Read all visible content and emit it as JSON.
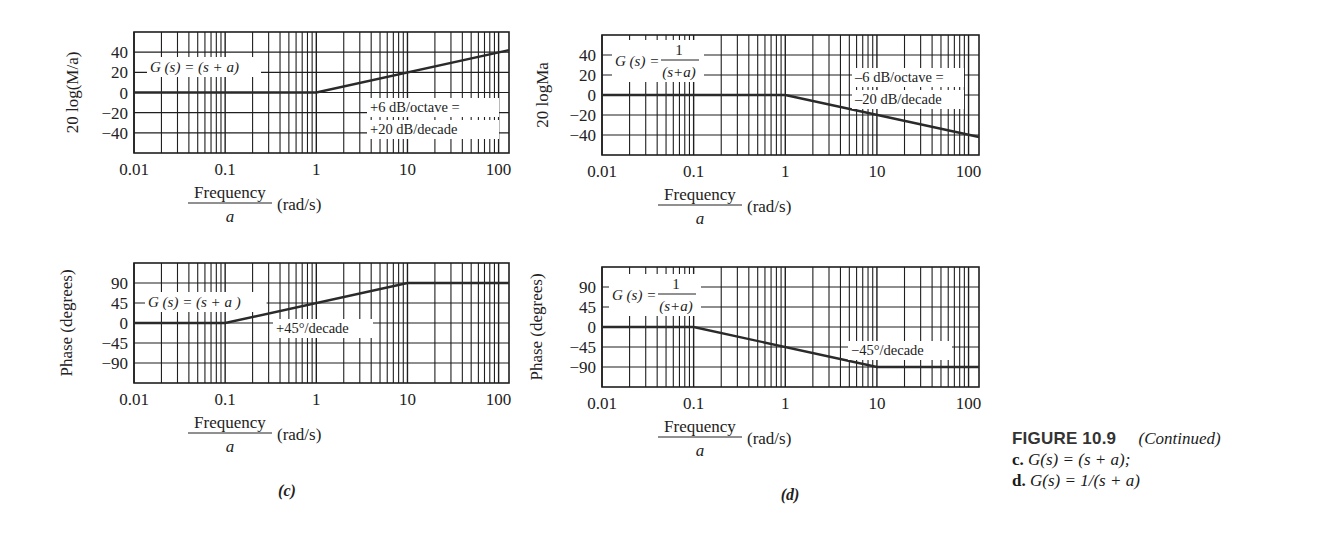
{
  "figure": {
    "number_label": "FIGURE 10.9",
    "continued_label": "(Continued)",
    "caption_lines": [
      {
        "prefix": "c.",
        "text": "G(s) = (s + a);"
      },
      {
        "prefix": "d.",
        "text": "G(s) = 1/(s + a)"
      }
    ],
    "panel_labels": [
      "(c)",
      "(d)"
    ]
  },
  "colors": {
    "grid": "#1f1f1f",
    "curve": "#2a2a2a",
    "text": "#1a1a1a",
    "background": "#ffffff"
  },
  "chart_data": [
    {
      "id": "c-magnitude",
      "type": "line",
      "panel": "c",
      "xscale": "log",
      "x_ticks": [
        "0.01",
        "0.1",
        "1",
        "10",
        "100"
      ],
      "xlim": [
        0.01,
        130
      ],
      "xlabel_num": "Frequency",
      "xlabel_den": "a",
      "xlabel_unit": "(rad/s)",
      "ylabel": "20 log(M/a)",
      "y_ticks": [
        40,
        20,
        0,
        -20,
        -40
      ],
      "ylim": [
        -60,
        60
      ],
      "grid": true,
      "transfer_function": "G (s) = (s + a)",
      "annotation": [
        "+6 dB/octave =",
        "+20 dB/decade"
      ],
      "series": [
        {
          "name": "asymptote",
          "x": [
            0.01,
            1,
            130
          ],
          "y": [
            0,
            0,
            42
          ]
        }
      ]
    },
    {
      "id": "d-magnitude",
      "type": "line",
      "panel": "d",
      "xscale": "log",
      "x_ticks": [
        "0.01",
        "0.1",
        "1",
        "10",
        "100"
      ],
      "xlim": [
        0.01,
        130
      ],
      "xlabel_num": "Frequency",
      "xlabel_den": "a",
      "xlabel_unit": "(rad/s)",
      "ylabel": "20 logMa",
      "y_ticks": [
        40,
        20,
        0,
        -20,
        -40
      ],
      "ylim": [
        -60,
        60
      ],
      "grid": true,
      "transfer_function_num": "1",
      "transfer_function_lhs": "G (s) =",
      "transfer_function_den": "(s+a)",
      "annotation": [
        "–6 dB/octave =",
        "–20 dB/decade"
      ],
      "series": [
        {
          "name": "asymptote",
          "x": [
            0.01,
            1,
            130
          ],
          "y": [
            0,
            0,
            -42
          ]
        }
      ]
    },
    {
      "id": "c-phase",
      "type": "line",
      "panel": "c",
      "xscale": "log",
      "x_ticks": [
        "0.01",
        "0.1",
        "1",
        "10",
        "100"
      ],
      "xlim": [
        0.01,
        130
      ],
      "xlabel_num": "Frequency",
      "xlabel_den": "a",
      "xlabel_unit": "(rad/s)",
      "ylabel": "Phase (degrees)",
      "y_ticks": [
        90,
        45,
        0,
        -45,
        -90
      ],
      "ylim": [
        -135,
        135
      ],
      "grid": true,
      "transfer_function": "G (s) = (s + a )",
      "annotation": [
        "+45°/decade"
      ],
      "series": [
        {
          "name": "asymptote",
          "x": [
            0.01,
            0.1,
            10,
            130
          ],
          "y": [
            0,
            0,
            90,
            90
          ]
        }
      ]
    },
    {
      "id": "d-phase",
      "type": "line",
      "panel": "d",
      "xscale": "log",
      "x_ticks": [
        "0.01",
        "0.1",
        "1",
        "10",
        "100"
      ],
      "xlim": [
        0.01,
        130
      ],
      "xlabel_num": "Frequency",
      "xlabel_den": "a",
      "xlabel_unit": "(rad/s)",
      "ylabel": "Phase (degrees)",
      "y_ticks": [
        90,
        45,
        0,
        -45,
        -90
      ],
      "ylim": [
        -135,
        135
      ],
      "grid": true,
      "transfer_function_num": "1",
      "transfer_function_lhs": "G (s) =",
      "transfer_function_den": "(s+a)",
      "annotation": [
        "−45°/decade"
      ],
      "series": [
        {
          "name": "asymptote",
          "x": [
            0.01,
            0.1,
            10,
            130
          ],
          "y": [
            0,
            0,
            -90,
            -90
          ]
        }
      ]
    }
  ]
}
